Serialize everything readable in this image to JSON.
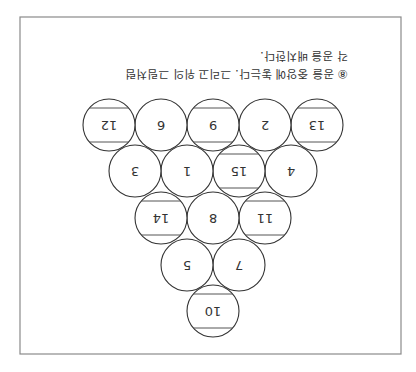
{
  "figure": {
    "orientation": "rotated-180",
    "caption_lines": [
      "⑧ 공을 중앙에 놓는다. 그리고 위의 그림처럼",
      "각 공을 배치한다."
    ],
    "ball_radius": 26,
    "rows": [
      {
        "row": 1,
        "balls": [
          {
            "number": "10",
            "striped": true
          }
        ]
      },
      {
        "row": 2,
        "balls": [
          {
            "number": "7",
            "striped": false
          },
          {
            "number": "5",
            "striped": false
          }
        ]
      },
      {
        "row": 3,
        "balls": [
          {
            "number": "11",
            "striped": true
          },
          {
            "number": "8",
            "striped": false
          },
          {
            "number": "14",
            "striped": true
          }
        ]
      },
      {
        "row": 4,
        "balls": [
          {
            "number": "4",
            "striped": false
          },
          {
            "number": "15",
            "striped": true
          },
          {
            "number": "1",
            "striped": false
          },
          {
            "number": "3",
            "striped": false
          }
        ]
      },
      {
        "row": 5,
        "balls": [
          {
            "number": "13",
            "striped": true
          },
          {
            "number": "2",
            "striped": false
          },
          {
            "number": "9",
            "striped": true
          },
          {
            "number": "6",
            "striped": false
          },
          {
            "number": "12",
            "striped": true
          }
        ]
      }
    ]
  }
}
